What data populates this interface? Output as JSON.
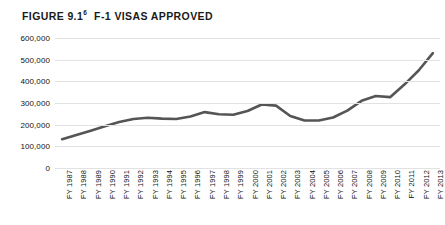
{
  "figure": {
    "label": "FIGURE 9.1",
    "note": "6",
    "title": "F-1 VISAS APPROVED"
  },
  "chart_data": {
    "type": "line",
    "title": "F-1 VISAS APPROVED",
    "xlabel": "",
    "ylabel": "",
    "ylim": [
      0,
      600000
    ],
    "ytick_labels": [
      "600,000",
      "500,000",
      "400,000",
      "300,000",
      "200,000",
      "100,000",
      "0"
    ],
    "ytick_values": [
      600000,
      500000,
      400000,
      300000,
      200000,
      100000,
      0
    ],
    "grid": true,
    "legend": "none",
    "line_color": "#555555",
    "categories": [
      "FY 1987",
      "FY 1988",
      "FY 1989",
      "FY 1990",
      "FY 1991",
      "FY 1992",
      "FY 1993",
      "FY 1994",
      "FY 1995",
      "FY 1996",
      "FY 1997",
      "FY 1998",
      "FY 1999",
      "FY 2000",
      "FY 2001",
      "FY 2002",
      "FY 2003",
      "FY 2004",
      "FY 2005",
      "FY 2006",
      "FY 2007",
      "FY 2008",
      "FY 2009",
      "FY 2010",
      "FY 2011",
      "FY 2012",
      "FY 2013"
    ],
    "values": [
      133000,
      152000,
      172000,
      193000,
      212000,
      226000,
      232000,
      228000,
      226000,
      238000,
      258000,
      248000,
      246000,
      263000,
      293000,
      288000,
      240000,
      219000,
      219000,
      233000,
      265000,
      310000,
      332000,
      327000,
      385000,
      450000,
      530000
    ]
  }
}
